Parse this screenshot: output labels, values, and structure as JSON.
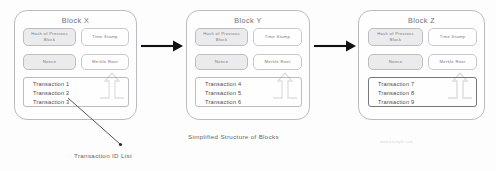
{
  "diagram": {
    "caption": "Simplified Structure of Blocks",
    "annotation": "Transaction ID List",
    "watermark": "www.example.com"
  },
  "field_labels": {
    "hash": "Hash of Previous Block",
    "timestamp": "Time Stamp",
    "nonce": "Nonce",
    "merkle": "Merkle Root"
  },
  "blocks": [
    {
      "title": "Block X",
      "hash": "Hash of Previous Block",
      "timestamp": "Time Stamp",
      "nonce": "Nonce",
      "merkle": "Merkle Root",
      "transactions": [
        "Transaction 1",
        "Transaction 2",
        "Transaction 3"
      ]
    },
    {
      "title": "Block Y",
      "hash": "Hash of Previous Block",
      "timestamp": "Time Stamp",
      "nonce": "Nonce",
      "merkle": "Merkle Root",
      "transactions": [
        "Transaction 4",
        "Transaction 5",
        "Transaction 6"
      ]
    },
    {
      "title": "Block Z",
      "hash": "Hash of Previous Block",
      "timestamp": "Time Stamp",
      "nonce": "Nonce",
      "merkle": "Merkle Root",
      "transactions": [
        "Transaction 7",
        "Transaction 8",
        "Transaction 9"
      ]
    }
  ],
  "colors": {
    "line": "#b9bbbe",
    "arrow": "#111111",
    "shade": "#eaeaec",
    "text": "#4b4c50"
  }
}
